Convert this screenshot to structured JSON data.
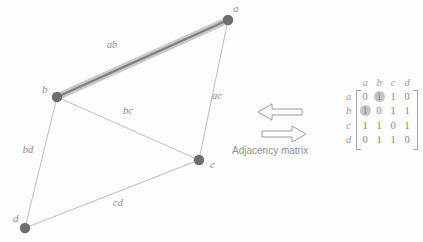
{
  "graph": {
    "nodes": [
      {
        "id": "a",
        "label": "a",
        "x": 228,
        "y": 20,
        "label_x": 233,
        "label_y": 12
      },
      {
        "id": "b",
        "label": "b",
        "x": 57,
        "y": 97,
        "label_x": 42,
        "label_y": 93
      },
      {
        "id": "c",
        "label": "c",
        "x": 199,
        "y": 160,
        "label_x": 210,
        "label_y": 168
      },
      {
        "id": "d",
        "label": "d",
        "x": 25,
        "y": 228,
        "label_x": 13,
        "label_y": 222
      }
    ],
    "edges": [
      {
        "id": "ab",
        "label": "ab",
        "from": "a",
        "to": "b",
        "highlighted": true,
        "label_x": 112,
        "label_y": 48
      },
      {
        "id": "ac",
        "label": "ac",
        "from": "a",
        "to": "c",
        "highlighted": false,
        "label_x": 217,
        "label_y": 99
      },
      {
        "id": "bc",
        "label": "bc",
        "from": "b",
        "to": "c",
        "highlighted": false,
        "label_x": 128,
        "label_y": 114
      },
      {
        "id": "bd",
        "label": "bd",
        "from": "b",
        "to": "d",
        "highlighted": false,
        "label_x": 28,
        "label_y": 153
      },
      {
        "id": "cd",
        "label": "cd",
        "from": "c",
        "to": "d",
        "highlighted": false,
        "label_x": 118,
        "label_y": 206
      }
    ]
  },
  "matrix": {
    "caption": "Adjacency matrix",
    "column_headers": [
      "a",
      "b",
      "c",
      "d"
    ],
    "row_headers": [
      "a",
      "b",
      "c",
      "d"
    ],
    "rows": [
      {
        "label": "a",
        "values": [
          "0",
          "1",
          "1",
          "0"
        ],
        "highlight": [
          false,
          true,
          false,
          false
        ]
      },
      {
        "label": "b",
        "values": [
          "1",
          "0",
          "1",
          "1"
        ],
        "highlight": [
          true,
          false,
          false,
          false
        ]
      },
      {
        "label": "c",
        "values": [
          "1",
          "1",
          "0",
          "1"
        ],
        "highlight": [
          false,
          false,
          false,
          false
        ]
      },
      {
        "label": "d",
        "values": [
          "0",
          "1",
          "1",
          "0"
        ],
        "highlight": [
          false,
          false,
          false,
          false
        ]
      }
    ]
  },
  "colors": {
    "node_fill": "#6e6e6e",
    "edge_stroke": "#bdbdbd",
    "edge_highlight_band": "#c9c9c9",
    "edge_highlight_core": "#777777",
    "text": "#8c8c8c",
    "highlight_circle": "#c4c4c4",
    "arrow_stroke": "#9a9a9a",
    "background": "#fdfdfd"
  },
  "arrows": [
    {
      "id": "arrow-left",
      "direction": "left"
    },
    {
      "id": "arrow-right",
      "direction": "right"
    }
  ]
}
